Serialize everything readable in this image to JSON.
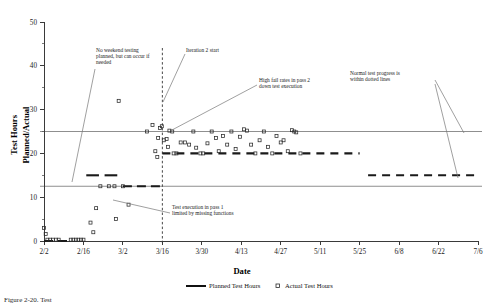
{
  "chart_data": {
    "type": "scatter",
    "title": "",
    "xlabel": "Date",
    "ylabel": "Test Hours Planned/Actual",
    "ylim": [
      0,
      50
    ],
    "yticks": [
      0,
      10,
      20,
      30,
      40,
      50
    ],
    "ytick_labels": [
      "0",
      "10",
      "20",
      "30",
      "40",
      "50"
    ],
    "xtick_labels": [
      "2/2",
      "2/16",
      "3/2",
      "3/16",
      "3/30",
      "4/13",
      "4/27",
      "5/11",
      "5/25",
      "6/8",
      "6/22",
      "7/6"
    ],
    "xlim_days": [
      0,
      154
    ],
    "xtick_days": [
      0,
      14,
      28,
      42,
      56,
      70,
      84,
      98,
      112,
      126,
      140,
      154
    ],
    "grid": false,
    "legend_position": "bottom-center",
    "series": [
      {
        "name": "Planned Test Hours",
        "type": "line",
        "style": "thick-dashed",
        "color": "#1a1a1a",
        "segments": [
          {
            "x_days": [
              0.0,
              9.0
            ],
            "y": 0
          },
          {
            "x_days": [
              15.0,
              19.5
            ],
            "y": 15
          },
          {
            "x_days": [
              21.5,
              26.0
            ],
            "y": 15
          },
          {
            "x_days": [
              28.0,
              42.0
            ],
            "y": 12.5
          },
          {
            "x_days": [
              42.0,
              112.0
            ],
            "y": 20
          },
          {
            "x_days": [
              115.0,
              154.0
            ],
            "y": 15
          }
        ]
      },
      {
        "name": "Actual Test Hours",
        "type": "scatter",
        "marker": "open-square",
        "color": "#2a2a2a",
        "points": [
          {
            "x_days": 0.0,
            "y": 3.0
          },
          {
            "x_days": 0.6,
            "y": 1.6
          },
          {
            "x_days": 1.2,
            "y": 0.3
          },
          {
            "x_days": 2.2,
            "y": 0.3
          },
          {
            "x_days": 3.2,
            "y": 0.3
          },
          {
            "x_days": 4.2,
            "y": 0.3
          },
          {
            "x_days": 5.2,
            "y": 0.3
          },
          {
            "x_days": 9.5,
            "y": 0.3
          },
          {
            "x_days": 10.4,
            "y": 0.3
          },
          {
            "x_days": 11.3,
            "y": 0.3
          },
          {
            "x_days": 12.2,
            "y": 0.3
          },
          {
            "x_days": 13.1,
            "y": 0.3
          },
          {
            "x_days": 14.0,
            "y": 0.3
          },
          {
            "x_days": 16.5,
            "y": 4.2
          },
          {
            "x_days": 17.5,
            "y": 2.0
          },
          {
            "x_days": 18.5,
            "y": 7.5
          },
          {
            "x_days": 20.0,
            "y": 12.5
          },
          {
            "x_days": 23.0,
            "y": 12.5
          },
          {
            "x_days": 25.0,
            "y": 12.5
          },
          {
            "x_days": 25.5,
            "y": 5.0
          },
          {
            "x_days": 28.0,
            "y": 12.5
          },
          {
            "x_days": 26.5,
            "y": 32.0
          },
          {
            "x_days": 30.0,
            "y": 8.3
          },
          {
            "x_days": 36.5,
            "y": 25.0
          },
          {
            "x_days": 38.5,
            "y": 26.5
          },
          {
            "x_days": 40.5,
            "y": 23.5
          },
          {
            "x_days": 41.2,
            "y": 25.8
          },
          {
            "x_days": 41.8,
            "y": 26.2
          },
          {
            "x_days": 39.5,
            "y": 20.5
          },
          {
            "x_days": 40.2,
            "y": 19.2
          },
          {
            "x_days": 42.5,
            "y": 23.0
          },
          {
            "x_days": 43.5,
            "y": 23.3
          },
          {
            "x_days": 44.5,
            "y": 25.2
          },
          {
            "x_days": 45.5,
            "y": 25.0
          },
          {
            "x_days": 44.0,
            "y": 21.5
          },
          {
            "x_days": 46.0,
            "y": 20.0
          },
          {
            "x_days": 47.0,
            "y": 20.0
          },
          {
            "x_days": 48.5,
            "y": 22.5
          },
          {
            "x_days": 50.0,
            "y": 22.5
          },
          {
            "x_days": 51.5,
            "y": 22.0
          },
          {
            "x_days": 53.0,
            "y": 25.0
          },
          {
            "x_days": 54.0,
            "y": 21.3
          },
          {
            "x_days": 55.5,
            "y": 20.0
          },
          {
            "x_days": 56.5,
            "y": 20.0
          },
          {
            "x_days": 58.0,
            "y": 22.3
          },
          {
            "x_days": 59.5,
            "y": 25.0
          },
          {
            "x_days": 61.0,
            "y": 23.5
          },
          {
            "x_days": 62.0,
            "y": 20.5
          },
          {
            "x_days": 63.5,
            "y": 24.0
          },
          {
            "x_days": 65.0,
            "y": 22.0
          },
          {
            "x_days": 66.5,
            "y": 25.0
          },
          {
            "x_days": 68.0,
            "y": 21.0
          },
          {
            "x_days": 69.5,
            "y": 23.8
          },
          {
            "x_days": 71.0,
            "y": 25.5
          },
          {
            "x_days": 72.0,
            "y": 25.2
          },
          {
            "x_days": 73.5,
            "y": 22.0
          },
          {
            "x_days": 75.0,
            "y": 20.0
          },
          {
            "x_days": 76.5,
            "y": 23.0
          },
          {
            "x_days": 78.0,
            "y": 25.0
          },
          {
            "x_days": 79.5,
            "y": 21.5
          },
          {
            "x_days": 81.0,
            "y": 20.0
          },
          {
            "x_days": 82.5,
            "y": 24.0
          },
          {
            "x_days": 84.0,
            "y": 22.5
          },
          {
            "x_days": 85.0,
            "y": 23.0
          },
          {
            "x_days": 86.5,
            "y": 20.5
          },
          {
            "x_days": 88.0,
            "y": 25.3
          },
          {
            "x_days": 88.8,
            "y": 25.0
          },
          {
            "x_days": 89.5,
            "y": 24.8
          },
          {
            "x_days": 91.0,
            "y": 20.0
          }
        ]
      }
    ],
    "reference_lines": [
      {
        "name": "upper-bound",
        "y": 25,
        "style": "thin-solid"
      },
      {
        "name": "lower-bound",
        "y": 12.5,
        "style": "thin-solid"
      }
    ],
    "vertical_markers": [
      {
        "name": "iteration-2-start",
        "x_days": 42,
        "style": "dashed"
      }
    ],
    "annotations": [
      {
        "id": "no-weekend-testing",
        "lines": [
          "No weekend testing",
          "planned, but can occur if",
          "needed"
        ],
        "text_x": 96,
        "text_y": 52,
        "leader": [
          [
            95,
            69
          ],
          [
            72,
            182
          ]
        ]
      },
      {
        "id": "iteration-2-start",
        "lines": [
          "Iteration 2 start"
        ],
        "text_x": 186,
        "text_y": 52,
        "leader": [
          [
            185,
            54
          ],
          [
            163,
            102
          ]
        ]
      },
      {
        "id": "high-fail-rates",
        "lines": [
          "High fail rates in pass 2",
          "down test execution"
        ],
        "text_x": 259,
        "text_y": 82,
        "leader": [
          [
            257,
            85
          ],
          [
            172,
            130
          ]
        ]
      },
      {
        "id": "normal-test-progress",
        "lines": [
          "Normal test progress is",
          "within dotted lines"
        ],
        "text_x": 350,
        "text_y": 75,
        "leader": [
          [
            435,
            80
          ],
          [
            464,
            133
          ]
        ],
        "leader2": [
          [
            435,
            84
          ],
          [
            458,
            178
          ]
        ]
      },
      {
        "id": "pass-1-limited",
        "lines": [
          "Test execution in pass 1",
          "limited by missing functions"
        ],
        "text_x": 172,
        "text_y": 209,
        "leader": [
          [
            170,
            213
          ],
          [
            113,
            200
          ]
        ]
      }
    ],
    "legend": [
      {
        "label": "Planned Test Hours",
        "marker": "line"
      },
      {
        "label": "Actual Test Hours",
        "marker": "open-square"
      }
    ]
  },
  "caption": {
    "text": "Figure 2-20.  Test"
  },
  "colors": {
    "axis": "#3a3a3a",
    "planned": "#1a1a1a",
    "actual": "#2a2a2a",
    "reference": "#5e5e5e",
    "leader": "#777777",
    "background": "#ffffff"
  }
}
